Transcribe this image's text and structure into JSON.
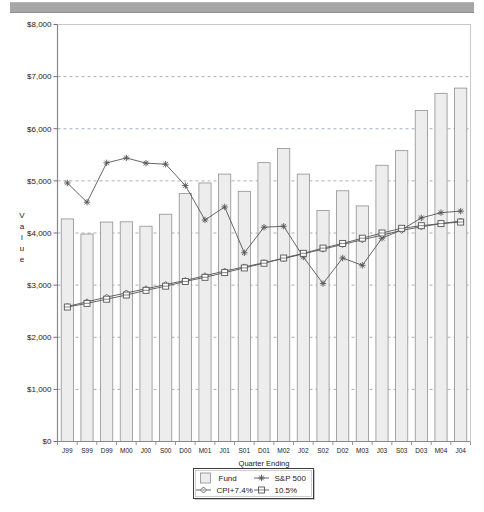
{
  "header": {
    "bar_color": "#a6a6a6"
  },
  "chart_data": {
    "type": "bar",
    "title": "",
    "xlabel": "Quarter Ending",
    "ylabel": "Value",
    "ylim": [
      0,
      8000
    ],
    "ytick_step": 1000,
    "grid": true,
    "legend_position": "bottom",
    "ytick_labels": [
      "$0",
      "$1,000",
      "$2,000",
      "$3,000",
      "$4,000",
      "$5,000",
      "$6,000",
      "$7,000",
      "$8,000"
    ],
    "ytick_values": [
      0,
      1000,
      2000,
      3000,
      4000,
      5000,
      6000,
      7000,
      8000
    ],
    "categories": [
      "J99",
      "S99",
      "D99",
      "M00",
      "J00",
      "S00",
      "D00",
      "M01",
      "J01",
      "S01",
      "D01",
      "M02",
      "J02",
      "S02",
      "D02",
      "M03",
      "J03",
      "S03",
      "D03",
      "M04",
      "J04"
    ],
    "series": [
      {
        "name": "Fund",
        "marker": "square-swatch",
        "kind": "bar",
        "color": "#ededed",
        "edge_color": "#909090",
        "values": [
          4270,
          3980,
          4210,
          4215,
          4130,
          4360,
          4760,
          4960,
          5130,
          4800,
          5350,
          5620,
          5130,
          4430,
          4810,
          4520,
          5300,
          5580,
          6350,
          6680,
          6780
        ]
      },
      {
        "name": "S&P 500",
        "marker": "asterisk",
        "kind": "line",
        "color": "#555555",
        "values": [
          4960,
          4590,
          5345,
          5440,
          5340,
          5320,
          4910,
          4250,
          4500,
          3620,
          4110,
          4130,
          3540,
          3030,
          3520,
          3380,
          3900,
          4060,
          4290,
          4390,
          4420
        ]
      },
      {
        "name": "CPI+7.4%",
        "marker": "diamond",
        "kind": "line",
        "color": "#555555",
        "values": [
          2590,
          2680,
          2770,
          2850,
          2930,
          3010,
          3090,
          3180,
          3270,
          3350,
          3430,
          3510,
          3600,
          3690,
          3780,
          3870,
          3960,
          4050,
          4120,
          4180,
          4230
        ]
      },
      {
        "name": "10.5%",
        "marker": "square",
        "kind": "line",
        "color": "#555555",
        "values": [
          2580,
          2650,
          2730,
          2810,
          2900,
          2980,
          3070,
          3150,
          3240,
          3330,
          3420,
          3520,
          3610,
          3710,
          3800,
          3900,
          4000,
          4090,
          4140,
          4180,
          4210
        ]
      }
    ]
  },
  "legend": {
    "items": [
      {
        "label": "Fund",
        "marker": "square-swatch"
      },
      {
        "label": "S&P 500",
        "marker": "asterisk"
      },
      {
        "label": "CPI+7.4%",
        "marker": "diamond"
      },
      {
        "label": "10.5%",
        "marker": "square"
      }
    ]
  },
  "vertical_axis_letters": [
    "V",
    "a",
    "l",
    "u",
    "e"
  ]
}
